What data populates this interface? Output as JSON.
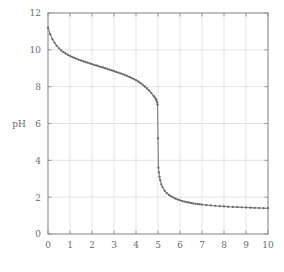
{
  "chart_data": {
    "type": "line",
    "title": "",
    "xlabel": "",
    "ylabel": "pH",
    "xlim": [
      0,
      10
    ],
    "ylim": [
      0,
      12
    ],
    "xticks": [
      0,
      1,
      2,
      3,
      4,
      5,
      6,
      7,
      8,
      9,
      10
    ],
    "xtick_labels": [
      "0",
      "1",
      "2",
      "3",
      "4",
      "5",
      "6",
      "7",
      "8",
      "9",
      "10"
    ],
    "yticks": [
      0,
      2,
      4,
      6,
      8,
      10,
      12
    ],
    "ytick_labels": [
      "0",
      "2",
      "4",
      "6",
      "8",
      "10",
      "12"
    ],
    "grid": true,
    "grid_color": "#d8d8d8",
    "legend": null,
    "line_color": "#7a7a7a",
    "marker": "dot",
    "marker_color": "#6a6a6a",
    "series": [
      {
        "name": "titration curve",
        "x": [
          0.0,
          0.1,
          0.2,
          0.3,
          0.4,
          0.5,
          0.6,
          0.7,
          0.8,
          0.9,
          1.0,
          1.1,
          1.2,
          1.3,
          1.4,
          1.5,
          1.6,
          1.7,
          1.8,
          1.9,
          2.0,
          2.1,
          2.2,
          2.3,
          2.4,
          2.5,
          2.6,
          2.7,
          2.8,
          2.9,
          3.0,
          3.1,
          3.2,
          3.3,
          3.4,
          3.5,
          3.6,
          3.7,
          3.8,
          3.9,
          4.0,
          4.1,
          4.2,
          4.3,
          4.4,
          4.5,
          4.6,
          4.7,
          4.8,
          4.85,
          4.9,
          4.93,
          4.96,
          4.98,
          5.0,
          5.02,
          5.04,
          5.07,
          5.1,
          5.15,
          5.2,
          5.3,
          5.4,
          5.5,
          5.6,
          5.7,
          5.8,
          5.9,
          6.0,
          6.1,
          6.2,
          6.3,
          6.4,
          6.5,
          6.6,
          6.7,
          6.8,
          6.9,
          7.0,
          7.2,
          7.4,
          7.6,
          7.8,
          8.0,
          8.2,
          8.4,
          8.6,
          8.8,
          9.0,
          9.2,
          9.4,
          9.6,
          9.8,
          10.0
        ],
        "y": [
          11.2,
          10.85,
          10.58,
          10.38,
          10.22,
          10.08,
          9.97,
          9.88,
          9.8,
          9.73,
          9.67,
          9.61,
          9.56,
          9.51,
          9.46,
          9.42,
          9.38,
          9.34,
          9.3,
          9.26,
          9.22,
          9.18,
          9.15,
          9.11,
          9.07,
          9.04,
          9.0,
          8.96,
          8.92,
          8.88,
          8.84,
          8.8,
          8.76,
          8.72,
          8.68,
          8.63,
          8.58,
          8.53,
          8.47,
          8.41,
          8.35,
          8.28,
          8.2,
          8.11,
          8.01,
          7.9,
          7.78,
          7.65,
          7.5,
          7.42,
          7.33,
          7.25,
          7.15,
          7.02,
          5.2,
          3.6,
          3.35,
          3.1,
          2.92,
          2.7,
          2.55,
          2.35,
          2.22,
          2.12,
          2.04,
          1.98,
          1.92,
          1.87,
          1.83,
          1.79,
          1.76,
          1.73,
          1.71,
          1.68,
          1.66,
          1.64,
          1.63,
          1.61,
          1.6,
          1.57,
          1.55,
          1.53,
          1.51,
          1.5,
          1.48,
          1.47,
          1.46,
          1.45,
          1.44,
          1.43,
          1.42,
          1.41,
          1.4,
          1.4
        ]
      }
    ]
  },
  "plot_geometry": {
    "left": 48,
    "right": 268,
    "top": 13,
    "bottom": 234
  }
}
